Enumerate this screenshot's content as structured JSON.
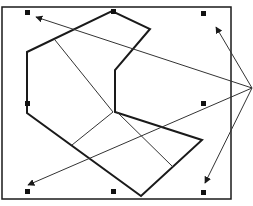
{
  "diagram": {
    "colors": {
      "stroke": "#1a1a1a",
      "thin_line": "#333333",
      "background": "#ffffff",
      "handle": "#111111"
    },
    "frame": {
      "x": 2,
      "y": 7,
      "width": 229,
      "height": 192
    },
    "shape_outline": [
      [
        27,
        52
      ],
      [
        112,
        11
      ],
      [
        150,
        29
      ],
      [
        115,
        70
      ],
      [
        115,
        112
      ],
      [
        202,
        140
      ],
      [
        141,
        196
      ],
      [
        27,
        113
      ]
    ],
    "inner_lines": [
      {
        "from": [
          55,
          40
        ],
        "to": [
          113,
          112
        ]
      },
      {
        "from": [
          113,
          112
        ],
        "to": [
          72,
          145
        ]
      },
      {
        "from": [
          117,
          112
        ],
        "to": [
          173,
          167
        ]
      }
    ],
    "handles": [
      {
        "name": "top-left",
        "x": 27,
        "y": 12
      },
      {
        "name": "top-center",
        "x": 113,
        "y": 11
      },
      {
        "name": "top-right",
        "x": 203,
        "y": 13
      },
      {
        "name": "middle-left",
        "x": 27,
        "y": 103
      },
      {
        "name": "middle-right",
        "x": 203,
        "y": 103
      },
      {
        "name": "bottom-left",
        "x": 27,
        "y": 191
      },
      {
        "name": "bottom-center",
        "x": 113,
        "y": 191
      },
      {
        "name": "bottom-right",
        "x": 203,
        "y": 192
      }
    ],
    "arrow_origin": [
      252,
      88
    ],
    "arrows": [
      {
        "name": "arrow-to-top-left",
        "to": [
          36,
          17
        ]
      },
      {
        "name": "arrow-to-top-right",
        "to": [
          216,
          27
        ]
      },
      {
        "name": "arrow-to-bottom-left",
        "to": [
          28,
          185
        ]
      },
      {
        "name": "arrow-to-bottom-right",
        "to": [
          205,
          183
        ]
      }
    ]
  }
}
